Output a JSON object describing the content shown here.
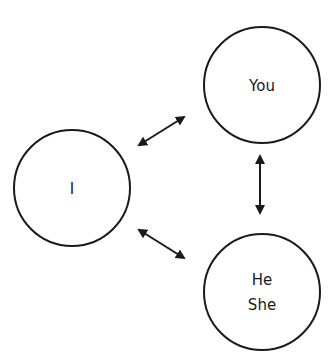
{
  "diagram": {
    "title": "",
    "colors": {
      "stroke": "#1a1a1a",
      "background": "#ffffff"
    },
    "nodes": [
      {
        "id": "i",
        "lines": [
          "I"
        ],
        "cx": 72,
        "cy": 188,
        "r": 58
      },
      {
        "id": "you",
        "lines": [
          "You"
        ],
        "cx": 262,
        "cy": 85,
        "r": 58
      },
      {
        "id": "he-she",
        "lines": [
          "He",
          "She"
        ],
        "cx": 262,
        "cy": 292,
        "r": 58
      }
    ],
    "edges": [
      {
        "id": "i-you",
        "from": "i",
        "to": "you",
        "type": "bidirectional",
        "x1": 144,
        "y1": 142,
        "x2": 184,
        "y2": 117
      },
      {
        "id": "you-he-she",
        "from": "you",
        "to": "he-she",
        "type": "bidirectional",
        "x1": 260,
        "y1": 162,
        "x2": 260,
        "y2": 213
      },
      {
        "id": "i-he-she",
        "from": "i",
        "to": "he-she",
        "type": "bidirectional",
        "x1": 144,
        "y1": 233,
        "x2": 184,
        "y2": 258
      }
    ]
  }
}
